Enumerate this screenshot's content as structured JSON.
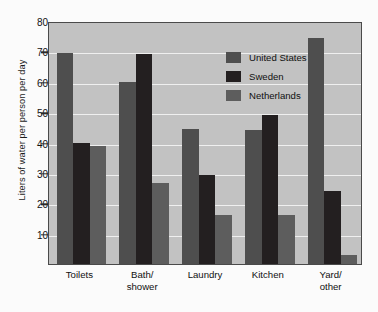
{
  "chart_data": {
    "type": "bar",
    "title": "",
    "subtitle": "",
    "xlabel": "",
    "ylabel": "Liters of water per person per day",
    "categories": [
      "Toilets",
      "Bath/ shower",
      "Laundry",
      "Kitchen",
      "Yard/ other"
    ],
    "category_lines": [
      [
        "Toilets"
      ],
      [
        "Bath/",
        "shower"
      ],
      [
        "Laundry"
      ],
      [
        "Kitchen"
      ],
      [
        "Yard/",
        "other"
      ]
    ],
    "series": [
      {
        "name": "United States",
        "color": "#4e4e4e",
        "values": [
          69.5,
          59.8,
          44.3,
          44.0,
          74.5
        ]
      },
      {
        "name": "Sweden",
        "color": "#231f20",
        "values": [
          39.8,
          69.3,
          29.4,
          49.2,
          24.0
        ]
      },
      {
        "name": "Netherlands",
        "color": "#5d5d5d",
        "values": [
          38.7,
          26.7,
          16.2,
          16.0,
          3.0
        ]
      }
    ],
    "ylim": [
      0,
      80
    ],
    "yticks": [
      10,
      20,
      30,
      40,
      50,
      60,
      70,
      80
    ],
    "ytick_labels": [
      "10",
      "20",
      "30",
      "40",
      "50",
      "60",
      "70",
      "80"
    ],
    "grid": true,
    "grid_color": "#efefef",
    "plot_background": "#c2c2c2",
    "figure_background": "#fbfbfb",
    "frame_color": "#4a4a4a",
    "legend_position": "top-center",
    "legend": [
      {
        "label": "United States",
        "color": "#4e4e4e"
      },
      {
        "label": "Sweden",
        "color": "#231f20"
      },
      {
        "label": "Netherlands",
        "color": "#5d5d5d"
      }
    ]
  }
}
